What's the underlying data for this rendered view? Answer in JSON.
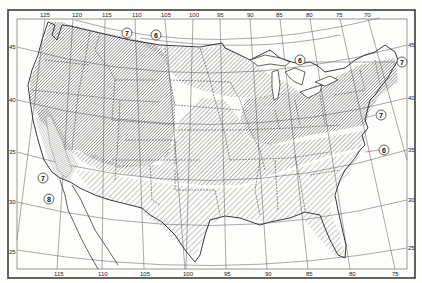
{
  "map": {
    "title": "",
    "subject": "United States zone map with hatched regions",
    "frame": {
      "outer_border": "#222222",
      "inner_border": "#444444"
    },
    "longitude_labels_top": [
      "125",
      "120",
      "115",
      "110",
      "105",
      "100",
      "95",
      "90",
      "85",
      "80",
      "75",
      "70"
    ],
    "longitude_labels_bottom": [
      "115",
      "110",
      "105",
      "100",
      "95",
      "90",
      "85",
      "80",
      "75"
    ],
    "latitude_labels_left": [
      "45",
      "40",
      "35",
      "30",
      "25"
    ],
    "latitude_labels_right": [
      "45",
      "40",
      "35",
      "30",
      "25"
    ],
    "zone_markers": [
      {
        "id": "marker-7-north",
        "label": "7"
      },
      {
        "id": "marker-6-north",
        "label": "6"
      },
      {
        "id": "marker-6-greatlakes",
        "label": "6"
      },
      {
        "id": "marker-7-newengland",
        "label": "7"
      },
      {
        "id": "marker-7-eastcoast",
        "label": "7"
      },
      {
        "id": "marker-6-eastcoast",
        "label": "6"
      },
      {
        "id": "marker-7-california",
        "label": "7"
      },
      {
        "id": "marker-8-california",
        "label": "8"
      }
    ],
    "hatch_zones": [
      {
        "name": "dense-northwest-northeast",
        "density": "dense",
        "color": "#555555"
      },
      {
        "name": "medium-central-band",
        "density": "medium",
        "color": "#666666"
      },
      {
        "name": "sparse-south",
        "density": "sparse",
        "color": "#777777"
      },
      {
        "name": "california-coastal-strip",
        "density": "fine",
        "color": "#555555"
      }
    ]
  }
}
